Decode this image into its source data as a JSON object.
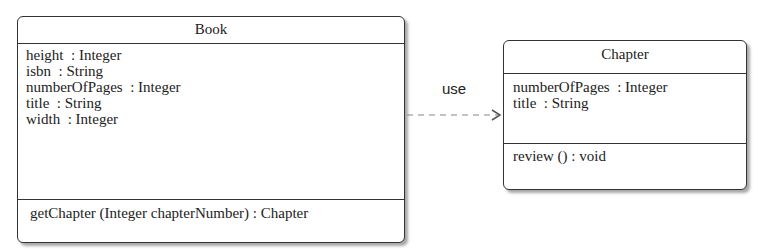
{
  "diagram": {
    "type": "UML class diagram",
    "classes": [
      {
        "name": "Book",
        "attributes": [
          "height  : Integer",
          "isbn  : String",
          "numberOfPages  : Integer",
          "title  : String",
          "width  : Integer"
        ],
        "methods": [
          "getChapter (Integer chapterNumber) : Chapter"
        ]
      },
      {
        "name": "Chapter",
        "attributes": [
          "numberOfPages  : Integer",
          "title  : String"
        ],
        "methods": [
          "review () : void"
        ]
      }
    ],
    "relationships": [
      {
        "from": "Book",
        "to": "Chapter",
        "kind": "dependency",
        "style": "dashed",
        "label": "use"
      }
    ]
  },
  "colors": {
    "line": "#333333",
    "dashed_line": "#888888",
    "background": "#ffffff"
  }
}
